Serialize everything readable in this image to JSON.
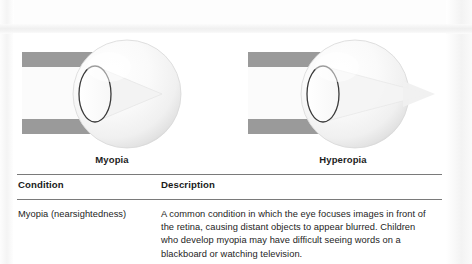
{
  "figures": [
    {
      "id": "myopia-diagram",
      "caption": "Myopia",
      "focus": "in-front-of-retina"
    },
    {
      "id": "hyperopia-diagram",
      "caption": "Hyperopia",
      "focus": "behind-retina"
    }
  ],
  "table": {
    "headers": {
      "condition": "Condition",
      "description": "Description"
    },
    "rows": [
      {
        "condition": "Myopia (nearsightedness)",
        "description": "A common condition in which the eye focuses images in front of the retina, causing distant objects to appear blurred. Children who develop myopia may have difficult seeing words on a blackboard or watching television."
      }
    ]
  },
  "colors": {
    "light_beam_gray": "#9a9a9a",
    "rule_gray": "#7a7a7a",
    "text_black": "#1a1a1a",
    "paper_white": "#ffffff"
  }
}
